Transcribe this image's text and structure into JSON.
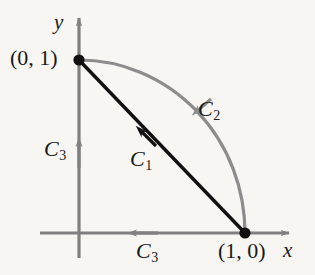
{
  "figure": {
    "background_color": "#f7f6f3",
    "axis_color": "#808080",
    "curve_c1_color": "#111111",
    "curve_c2_color": "#8c8c8c",
    "point_color": "#111111"
  },
  "axes": {
    "x_label": "x",
    "y_label": "y",
    "origin_px": [
      79,
      233
    ],
    "x_axis_tip_px": [
      295,
      233
    ],
    "y_axis_tip_px": [
      79,
      12
    ]
  },
  "points": [
    {
      "name": "point-0-1",
      "label": "(0, 1)",
      "coords": [
        0,
        1
      ],
      "px": [
        79,
        60
      ]
    },
    {
      "name": "point-1-0",
      "label": "(1, 0)",
      "coords": [
        1,
        0
      ],
      "px": [
        245,
        233
      ]
    }
  ],
  "curves": [
    {
      "name": "C1",
      "letter": "C",
      "subscript": "1",
      "label": "C₁",
      "type": "line-segment",
      "color": "#111111",
      "from": [
        1,
        0
      ],
      "to": [
        0,
        1
      ],
      "direction": "from (1, 0) to (0, 1)",
      "arrow_px": [
        136,
        127
      ]
    },
    {
      "name": "C2",
      "letter": "C",
      "subscript": "2",
      "label": "C₂",
      "type": "quarter-circle-arc",
      "color": "#8c8c8c",
      "from": [
        1,
        0
      ],
      "to": [
        0,
        1
      ],
      "radius": 1,
      "center": [
        0,
        0
      ],
      "direction": "from (1, 0) to (0, 1) counterclockwise (arrow points toward (0, 1))",
      "arrow_px": [
        193,
        115
      ]
    },
    {
      "name": "C3-left",
      "letter": "C",
      "subscript": "3",
      "label": "C₃",
      "type": "axis-segment",
      "color": "#808080",
      "axis": "y",
      "direction": "upward along the y-axis toward (0, 1)",
      "arrow_px": [
        79,
        137
      ]
    },
    {
      "name": "C3-bottom",
      "letter": "C",
      "subscript": "3",
      "label": "C₃",
      "type": "axis-segment",
      "color": "#808080",
      "axis": "x",
      "direction": "leftward along the x-axis toward the origin",
      "arrow_px": [
        127,
        233
      ]
    }
  ]
}
